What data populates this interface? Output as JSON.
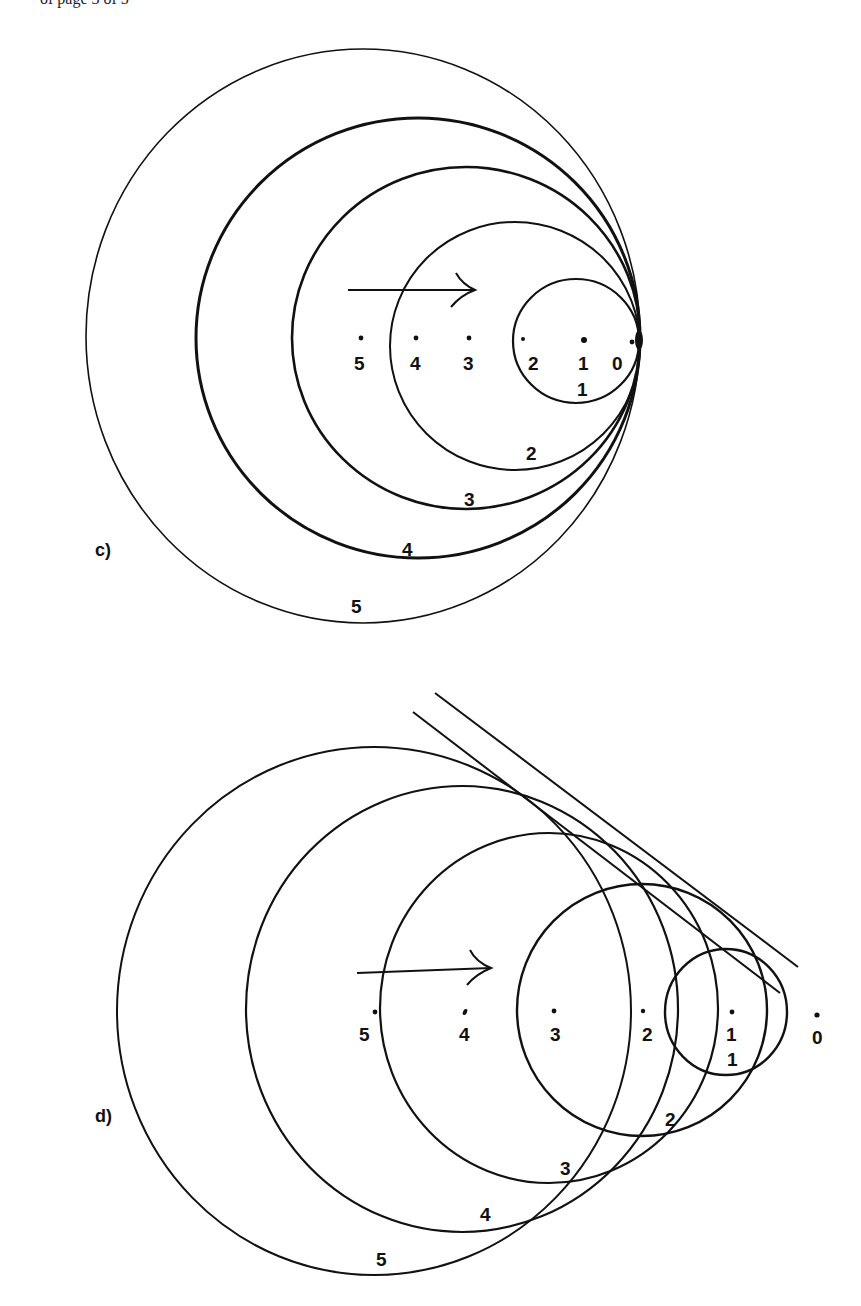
{
  "header_fragment": "of page 3 of 5",
  "panels": [
    {
      "id": "c",
      "label": "c)",
      "description": "Circular wavefronts from a source moving right at sound speed; all circles tangent at point 0",
      "arrow": {
        "direction": "right"
      },
      "points": [
        {
          "label": "5",
          "x": 361,
          "y": 338
        },
        {
          "label": "4",
          "x": 416,
          "y": 338
        },
        {
          "label": "3",
          "x": 469,
          "y": 338
        },
        {
          "label": "2",
          "x": 523,
          "y": 339
        },
        {
          "label": "1",
          "x": 584,
          "y": 340
        },
        {
          "label": "0",
          "x": 632,
          "y": 342
        }
      ],
      "circles": [
        {
          "label": "1",
          "cx": 576,
          "cy": 341,
          "rx": 63,
          "ry": 62
        },
        {
          "label": "2",
          "cx": 515,
          "cy": 346,
          "rx": 125,
          "ry": 124
        },
        {
          "label": "3",
          "cx": 466,
          "cy": 338,
          "rx": 174,
          "ry": 171
        },
        {
          "label": "4",
          "cx": 418,
          "cy": 338,
          "rx": 222,
          "ry": 220
        },
        {
          "label": "5",
          "cx": 363,
          "cy": 336,
          "rx": 277,
          "ry": 287
        }
      ],
      "circle_labels": [
        {
          "text": "1",
          "x": 583,
          "y": 396
        },
        {
          "text": "2",
          "x": 532,
          "y": 460
        },
        {
          "text": "3",
          "x": 470,
          "y": 506
        },
        {
          "text": "4",
          "x": 408,
          "y": 556
        },
        {
          "text": "5",
          "x": 357,
          "y": 613
        }
      ]
    },
    {
      "id": "d",
      "label": "d)",
      "description": "Circular wavefronts from a source moving right faster than sound; envelope forms a Mach cone",
      "arrow": {
        "direction": "right"
      },
      "points": [
        {
          "label": "5",
          "x": 375,
          "y": 1012
        },
        {
          "label": "4",
          "x": 465,
          "y": 1012
        },
        {
          "label": "3",
          "x": 554,
          "y": 1011
        },
        {
          "label": "2",
          "x": 643,
          "y": 1011
        },
        {
          "label": "1",
          "x": 732,
          "y": 1012
        },
        {
          "label": "0",
          "x": 817,
          "y": 1015
        }
      ],
      "circles": [
        {
          "label": "1",
          "cx": 726,
          "cy": 1012,
          "rx": 61,
          "ry": 63
        },
        {
          "label": "2",
          "cx": 642,
          "cy": 1010,
          "rx": 125,
          "ry": 126
        },
        {
          "label": "3",
          "cx": 549,
          "cy": 1008,
          "rx": 169,
          "ry": 175
        },
        {
          "label": "4",
          "cx": 462,
          "cy": 1009,
          "rx": 216,
          "ry": 223
        },
        {
          "label": "5",
          "cx": 374,
          "cy": 1011,
          "rx": 257,
          "ry": 264
        }
      ],
      "circle_labels": [
        {
          "text": "1",
          "x": 733,
          "y": 1066
        },
        {
          "text": "2",
          "x": 671,
          "y": 1126
        },
        {
          "text": "3",
          "x": 566,
          "y": 1175
        },
        {
          "text": "4",
          "x": 486,
          "y": 1221
        },
        {
          "text": "5",
          "x": 382,
          "y": 1266
        }
      ],
      "tangent_lines": [
        {
          "x1": 435,
          "y1": 693,
          "x2": 798,
          "y2": 967
        },
        {
          "x1": 413,
          "y1": 712,
          "x2": 780,
          "y2": 993
        }
      ]
    }
  ]
}
